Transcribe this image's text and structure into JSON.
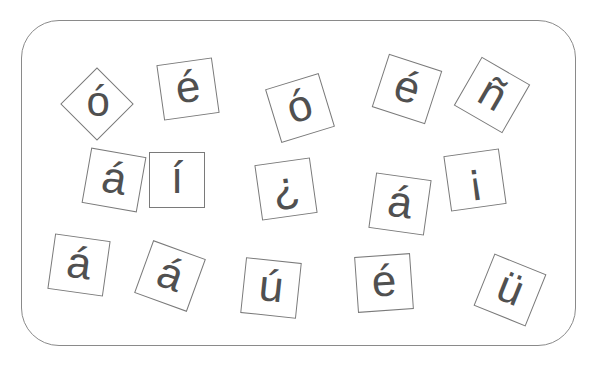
{
  "board": {
    "border_color": "#8a8a8a",
    "tile_border_color": "#7a7a7a",
    "glyph_color": "#505050"
  },
  "tiles": [
    {
      "char": "ó",
      "x": 97,
      "y": 104,
      "rotate": 45
    },
    {
      "char": "é",
      "x": 188,
      "y": 89,
      "rotate": -8
    },
    {
      "char": "ó",
      "x": 300,
      "y": 108,
      "rotate": -17
    },
    {
      "char": "é",
      "x": 407,
      "y": 89,
      "rotate": 18
    },
    {
      "char": "ñ",
      "x": 492,
      "y": 95,
      "rotate": 30
    },
    {
      "char": "á",
      "x": 114,
      "y": 180,
      "rotate": 10
    },
    {
      "char": "í",
      "x": 177,
      "y": 180,
      "rotate": 0
    },
    {
      "char": "¿",
      "x": 286,
      "y": 189,
      "rotate": -8
    },
    {
      "char": "á",
      "x": 400,
      "y": 204,
      "rotate": 8
    },
    {
      "char": "¡",
      "x": 475,
      "y": 180,
      "rotate": -8
    },
    {
      "char": "á",
      "x": 79,
      "y": 265,
      "rotate": 8
    },
    {
      "char": "á",
      "x": 170,
      "y": 276,
      "rotate": 20
    },
    {
      "char": "ú",
      "x": 271,
      "y": 288,
      "rotate": 6
    },
    {
      "char": "é",
      "x": 384,
      "y": 283,
      "rotate": -4
    },
    {
      "char": "ü",
      "x": 510,
      "y": 290,
      "rotate": 22
    }
  ]
}
